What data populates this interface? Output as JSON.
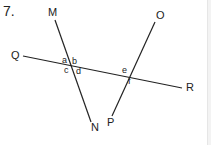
{
  "question_number": "7.",
  "lines": [
    {
      "id": "MN",
      "from": "M",
      "to": "N",
      "x1": 55,
      "y1": 20,
      "x2": 91,
      "y2": 122
    },
    {
      "id": "QR",
      "from": "Q",
      "to": "R",
      "x1": 23,
      "y1": 56,
      "x2": 182,
      "y2": 88
    },
    {
      "id": "OP",
      "from": "O",
      "to": "P",
      "x1": 155,
      "y1": 22,
      "x2": 112,
      "y2": 116
    }
  ],
  "points": {
    "M": "M",
    "N": "N",
    "O": "O",
    "P": "P",
    "Q": "Q",
    "R": "R"
  },
  "angles": {
    "a": "a",
    "b": "b",
    "c": "c",
    "d": "d",
    "e": "e",
    "f": "f"
  },
  "colors": {
    "line": "#222222",
    "text": "#222222",
    "background": "#ffffff"
  }
}
